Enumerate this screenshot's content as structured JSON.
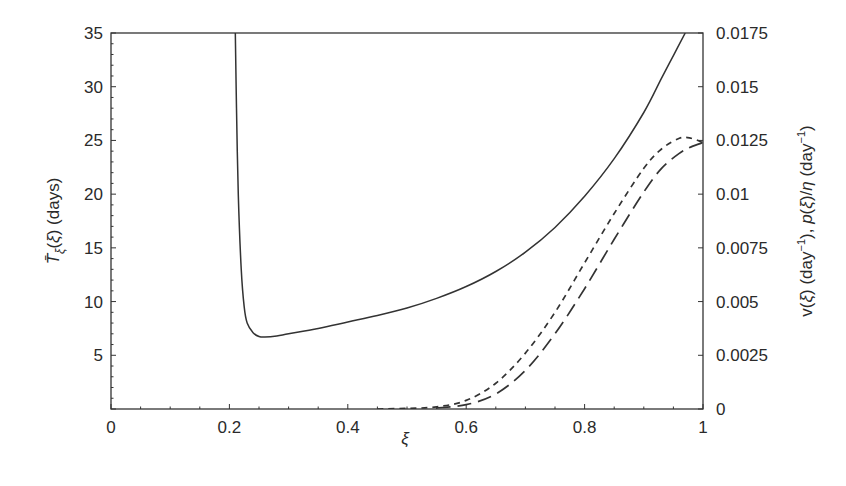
{
  "chart_data": {
    "type": "line",
    "title": "",
    "xlabel": "ξ",
    "ylabel_left": "T̄ξ(ξ) (days)",
    "ylabel_right": "v(ξ) (day⁻¹), p(ξ)/η (day⁻¹)",
    "xlim": [
      0,
      1
    ],
    "ylim_left": [
      0,
      35
    ],
    "ylim_right": [
      0,
      0.0175
    ],
    "x_ticks": [
      "0",
      "0.2",
      "0.4",
      "0.6",
      "0.8",
      "1"
    ],
    "y_left_ticks": [
      "5",
      "10",
      "15",
      "20",
      "25",
      "30",
      "35"
    ],
    "y_right_ticks": [
      "0",
      "0.0025",
      "0.005",
      "0.0075",
      "0.01",
      "0.0125",
      "0.015",
      "0.0175"
    ],
    "grid": false,
    "legend": null,
    "series": [
      {
        "name": "T̄ξ(ξ)",
        "axis": "left",
        "style": "solid",
        "x": [
          0.21,
          0.212,
          0.215,
          0.22,
          0.225,
          0.23,
          0.24,
          0.25,
          0.26,
          0.28,
          0.3,
          0.35,
          0.4,
          0.45,
          0.5,
          0.55,
          0.6,
          0.65,
          0.7,
          0.75,
          0.8,
          0.85,
          0.9,
          0.93,
          0.95,
          0.97
        ],
        "values": [
          35,
          28,
          20,
          13,
          9.5,
          8.0,
          7.1,
          6.75,
          6.7,
          6.8,
          7.0,
          7.5,
          8.1,
          8.7,
          9.4,
          10.3,
          11.4,
          12.8,
          14.6,
          16.9,
          19.8,
          23.3,
          27.6,
          30.8,
          32.9,
          35
        ]
      },
      {
        "name": "v(ξ)",
        "axis": "right",
        "style": "short-dash",
        "x": [
          0.45,
          0.5,
          0.55,
          0.6,
          0.65,
          0.7,
          0.75,
          0.8,
          0.85,
          0.9,
          0.93,
          0.96,
          0.98,
          1.0
        ],
        "values": [
          0,
          3e-05,
          0.0001,
          0.0004,
          0.0012,
          0.0026,
          0.0045,
          0.0068,
          0.0091,
          0.0112,
          0.0121,
          0.0126,
          0.0126,
          0.0124
        ]
      },
      {
        "name": "p(ξ)/η",
        "axis": "right",
        "style": "long-dash",
        "x": [
          0.55,
          0.6,
          0.65,
          0.7,
          0.75,
          0.8,
          0.85,
          0.9,
          0.93,
          0.96,
          0.98,
          1.0
        ],
        "values": [
          5e-05,
          0.0002,
          0.0007,
          0.0018,
          0.0035,
          0.0056,
          0.0079,
          0.0101,
          0.0112,
          0.0119,
          0.0122,
          0.0124
        ]
      }
    ]
  }
}
